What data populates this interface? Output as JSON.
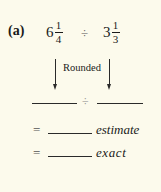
{
  "problem": {
    "label": "(a)",
    "first_number": {
      "whole": "6",
      "numerator": "1",
      "denominator": "4"
    },
    "operator": "÷",
    "second_number": {
      "whole": "3",
      "numerator": "1",
      "denominator": "3"
    },
    "rounded_label": "Rounded"
  },
  "work": {
    "operator": "÷",
    "equals_symbol": "=",
    "estimate_label": "estimate",
    "exact_label": "exact"
  },
  "colors": {
    "background": "#fcfaec",
    "ink": "#1a1a1a"
  }
}
